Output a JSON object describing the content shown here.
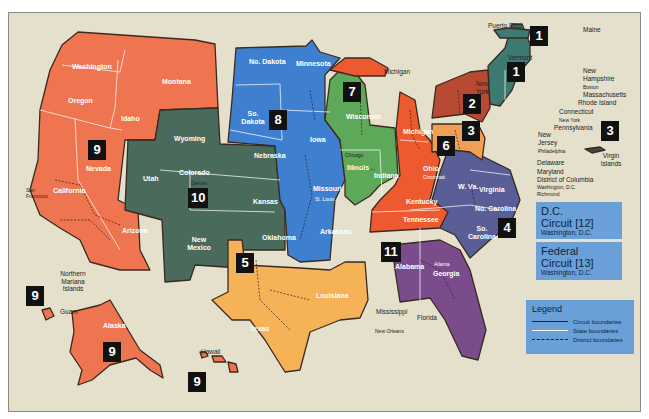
{
  "map": {
    "colors": {
      "background": "#e4e0cc",
      "circuit_1": "#3f7a72",
      "circuit_2": "#b84a34",
      "circuit_3": "#f0a055",
      "circuit_4": "#5a5e96",
      "circuit_5": "#f5b257",
      "circuit_6": "#ee5a30",
      "circuit_7": "#5ea85a",
      "circuit_8": "#3f7fd0",
      "circuit_9": "#ef7450",
      "circuit_10": "#4a6b5c",
      "circuit_11": "#7a4c8c",
      "info_box": "#6a9fd8"
    },
    "circuit_badges": [
      {
        "id": "1",
        "label": "1",
        "note": "Puerto Rico"
      },
      {
        "id": "1b",
        "label": "1",
        "note": "New England"
      },
      {
        "id": "2",
        "label": "2"
      },
      {
        "id": "3",
        "label": "3"
      },
      {
        "id": "3b",
        "label": "3",
        "note": "Virgin Islands"
      },
      {
        "id": "4",
        "label": "4"
      },
      {
        "id": "5",
        "label": "5"
      },
      {
        "id": "6",
        "label": "6"
      },
      {
        "id": "7",
        "label": "7"
      },
      {
        "id": "8",
        "label": "8"
      },
      {
        "id": "9",
        "label": "9",
        "note": "West"
      },
      {
        "id": "9b",
        "label": "9",
        "note": "Northern Mariana Islands / Guam"
      },
      {
        "id": "9c",
        "label": "9",
        "note": "Alaska"
      },
      {
        "id": "9d",
        "label": "9",
        "note": "Hawaii"
      },
      {
        "id": "10",
        "label": "10"
      },
      {
        "id": "11",
        "label": "11"
      }
    ],
    "states": {
      "washington": "Washington",
      "oregon": "Oregon",
      "idaho": "Idaho",
      "montana": "Montana",
      "nevada": "Nevada",
      "california": "California",
      "arizona": "Arizona",
      "alaska": "Alaska",
      "wyoming": "Wyoming",
      "utah": "Utah",
      "colorado": "Colorado",
      "kansas": "Kansas",
      "new_mexico": "New Mexico",
      "oklahoma": "Oklahoma",
      "no_dakota": "No. Dakota",
      "so_dakota": "So. Dakota",
      "nebraska": "Nebraska",
      "minnesota": "Minnesota",
      "iowa": "Iowa",
      "missouri": "Missouri",
      "arkansas": "Arkansas",
      "texas": "Texas",
      "louisiana": "Louisiana",
      "wisconsin": "Wisconsin",
      "illinois": "Illinois",
      "indiana": "Indiana",
      "michigan_lower": "Michigan",
      "ohio": "Ohio",
      "kentucky": "Kentucky",
      "tennessee": "Tennessee",
      "alabama": "Alabama",
      "georgia": "Georgia",
      "w_va": "W. Va.",
      "virginia": "Virginia",
      "no_carolina": "No. Carolina",
      "so_carolina": "So. Carolina"
    },
    "external_labels": {
      "puerto_rico": "Puerto Rico",
      "maine": "Maine",
      "vermont": "Vermont",
      "new_hampshire": "New Hampshire",
      "boston": "Boston",
      "massachusetts": "Massachusetts",
      "rhode_island": "Rhode Island",
      "connecticut": "Connecticut",
      "new_york_city": "New York",
      "new_york_state": "New York",
      "pennsylvania": "Pennsylvania",
      "new_jersey": "New Jersey",
      "philadelphia": "Philadelphia",
      "delaware": "Delaware",
      "maryland": "Maryland",
      "district_of_columbia": "District of Columbia",
      "washington_dc": "Washington, D.C.",
      "richmond": "Richmond",
      "virgin_islands": "Virgin Islands",
      "michigan_upper": "Michigan",
      "mississippi": "Mississippi",
      "new_orleans": "New Orleans",
      "florida": "Florida",
      "hawaii": "Hawaii",
      "guam": "Guam",
      "northern_mariana_islands": "Northern Mariana Islands",
      "san_francisco": "San Francisco",
      "denver": "Denver",
      "st_louis": "St. Louis",
      "chicago": "Chicago",
      "cincinnati": "Cincinnati",
      "atlanta": "Atlanta"
    },
    "info_boxes": [
      {
        "title_line1": "D.C.",
        "title_line2": "Circuit [12]",
        "subtitle": "Washington, D.C."
      },
      {
        "title_line1": "Federal",
        "title_line2": "Circuit [13]",
        "subtitle": "Washington, D.C."
      }
    ],
    "legend": {
      "title": "Legend",
      "items": [
        {
          "label": "Circuit boundaries",
          "style": "solid-dark"
        },
        {
          "label": "State boundaries",
          "style": "solid-white"
        },
        {
          "label": "District boundaries",
          "style": "dashed-dark"
        }
      ]
    }
  }
}
